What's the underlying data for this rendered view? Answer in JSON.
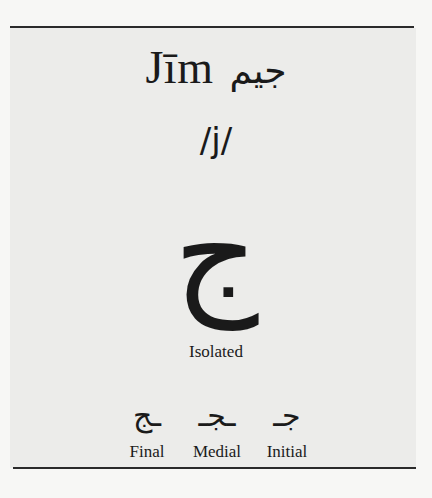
{
  "letter": {
    "name_latin": "Jīm",
    "name_arabic": "جيم",
    "phoneme": "/j/",
    "isolated_glyph": "ج",
    "isolated_label": "Isolated"
  },
  "forms": [
    {
      "label": "Final",
      "glyph": "ـج"
    },
    {
      "label": "Medial",
      "glyph": "ـجـ"
    },
    {
      "label": "Initial",
      "glyph": "جـ"
    }
  ],
  "colors": {
    "text": "#1a1a1a",
    "rule": "#2a2a2a",
    "panel_background": "#ececea",
    "page_background": "#f7f7f5"
  }
}
